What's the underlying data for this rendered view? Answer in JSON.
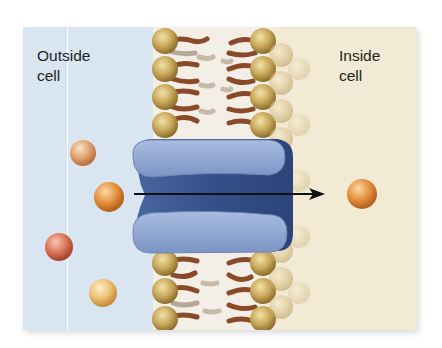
{
  "diagram": {
    "type": "membrane transport via channel protein",
    "labels": {
      "outside": [
        "Outside",
        "cell"
      ],
      "inside": [
        "Inside",
        "cell"
      ]
    },
    "colors": {
      "outside_bg": "#d9e6f2",
      "inside_bg": "#f2ead4",
      "phospholipid_head": "#c9a95c",
      "lipid_tail": "#8a4a2a",
      "channel_protein_light": "#8fa7cf",
      "channel_protein_dark": "#3f5a94",
      "arrow": "#111111",
      "solute": "#e39a55"
    },
    "elements": {
      "membrane": "phospholipid bilayer",
      "protein": "channel protein",
      "arrow_direction": "outside to inside",
      "solutes_outside": 4,
      "solutes_inside": 1
    }
  }
}
